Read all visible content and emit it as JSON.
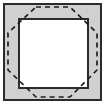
{
  "figure": {
    "canvas": {
      "width": 107,
      "height": 105,
      "background": "#ffffff"
    },
    "colors": {
      "background": "#ffffff",
      "band_fill": "#d0d0d0",
      "inner_fill": "#ffffff",
      "outline": "#2b2b2b",
      "dashed_stroke": "#1f1f1f"
    },
    "outer_square": {
      "label": "outer square",
      "x": 4,
      "y": 4,
      "width": 97,
      "height": 96,
      "fill": "#d0d0d0",
      "stroke": "#2b2b2b",
      "stroke_width": 1.6
    },
    "inner_square": {
      "label": "inner square",
      "x": 19,
      "y": 19,
      "width": 69,
      "height": 69,
      "fill": "#ffffff",
      "stroke": "#2b2b2b",
      "stroke_width": 1.6
    },
    "dashed_octagon": {
      "label": "dashed octagon",
      "stroke": "#1f1f1f",
      "stroke_width": 1.7,
      "dash_pattern": "5 4",
      "fill": "none",
      "points": "36,7 70,7 97,33 97,70 70,97 36,97 8,70 8,33",
      "vertices": [
        {
          "name": "top-left",
          "x": 36,
          "y": 7
        },
        {
          "name": "top-right",
          "x": 70,
          "y": 7
        },
        {
          "name": "right-top",
          "x": 97,
          "y": 33
        },
        {
          "name": "right-bottom",
          "x": 97,
          "y": 70
        },
        {
          "name": "bottom-right",
          "x": 70,
          "y": 97
        },
        {
          "name": "bottom-left",
          "x": 36,
          "y": 97
        },
        {
          "name": "left-bottom",
          "x": 8,
          "y": 70
        },
        {
          "name": "left-top",
          "x": 8,
          "y": 33
        }
      ]
    }
  }
}
